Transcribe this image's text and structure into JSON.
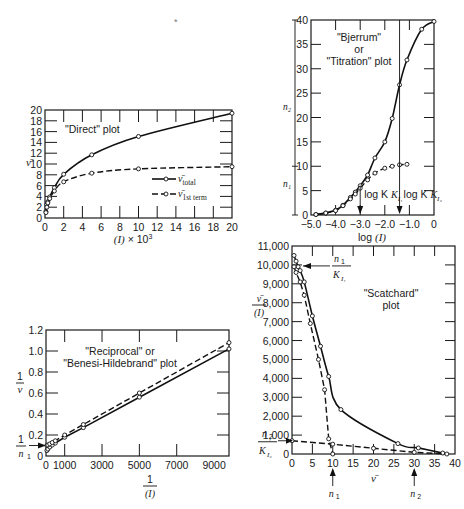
{
  "figure": {
    "stray_mark": "*"
  },
  "chart_data": [
    {
      "id": "direct",
      "type": "line",
      "title": "\"Direct\" plot",
      "xlabel": "(I) × 10³",
      "ylabel": "ν̄",
      "xlim": [
        0,
        20
      ],
      "ylim": [
        0,
        20
      ],
      "xticks": [
        0,
        2,
        4,
        6,
        8,
        10,
        12,
        14,
        16,
        18,
        20
      ],
      "yticks": [
        0,
        2,
        4,
        6,
        8,
        10,
        12,
        14,
        16,
        18,
        20
      ],
      "legend": [
        {
          "label": "ν̄",
          "sub": "total",
          "style": "solid"
        },
        {
          "label": "ν̄",
          "sub": "1st term",
          "style": "dashed"
        }
      ],
      "series": [
        {
          "name": "ν̄ total",
          "style": "solid",
          "x": [
            0.1,
            0.2,
            0.3,
            0.5,
            1,
            2,
            5,
            10,
            20
          ],
          "y": [
            1.2,
            2.5,
            3.0,
            3.9,
            5.6,
            8.1,
            11.7,
            15.1,
            19.4
          ]
        },
        {
          "name": "ν̄ 1st term",
          "style": "dashed",
          "x": [
            0.1,
            0.2,
            0.3,
            0.5,
            1,
            2,
            5,
            10,
            20
          ],
          "y": [
            1.0,
            2.0,
            2.8,
            3.6,
            5.0,
            6.7,
            8.3,
            9.1,
            9.5
          ]
        }
      ]
    },
    {
      "id": "bjerrum",
      "type": "line",
      "title": "\"Bjerrum\" or \"Titration\" plot",
      "title_lines": [
        "\"Bjerrum\"",
        "or",
        "\"Titration\" plot"
      ],
      "xlabel": "log (I)",
      "ylabel_upper": "n₂",
      "ylabel_lower": "n₁",
      "xlim": [
        -5.0,
        0
      ],
      "ylim": [
        0,
        40
      ],
      "xticks": [
        -5.0,
        -4.0,
        -3.0,
        -2.0,
        -1.0,
        0
      ],
      "xtick_labels": [
        "−5.0",
        "−4.0",
        "−3.0",
        "−2.0",
        "−1.0",
        "0"
      ],
      "yticks": [
        0,
        5,
        10,
        15,
        20,
        25,
        30,
        35,
        40
      ],
      "annotations": [
        {
          "text": "log K",
          "sub": "I₁",
          "x": -3.0
        },
        {
          "text": "log K",
          "sub": "I₂",
          "x": -1.4
        }
      ],
      "series": [
        {
          "name": "ν̄ total",
          "style": "solid",
          "x": [
            -4.8,
            -4.4,
            -4.0,
            -3.7,
            -3.4,
            -3.2,
            -3.0,
            -2.7,
            -2.4,
            -2.0,
            -1.7,
            -1.4,
            -1.1,
            -0.5,
            0
          ],
          "y": [
            0.1,
            0.4,
            1.0,
            2.0,
            3.6,
            4.7,
            6.0,
            8.2,
            11.7,
            15.0,
            19.8,
            26.7,
            31.8,
            38.1,
            39.7
          ]
        },
        {
          "name": "ν̄ 1st term",
          "style": "dashed",
          "x": [
            -4.8,
            -4.4,
            -4.0,
            -3.7,
            -3.4,
            -3.2,
            -3.0,
            -2.7,
            -2.4,
            -2.0,
            -1.7,
            -1.4,
            -1.1
          ],
          "y": [
            0.1,
            0.4,
            0.9,
            1.9,
            3.3,
            4.3,
            5.5,
            7.2,
            8.6,
            9.6,
            10.0,
            10.3,
            10.4
          ]
        }
      ]
    },
    {
      "id": "reciprocal",
      "type": "line",
      "title": "\"Reciprocal\" or \"Benesi-Hildebrand\" plot",
      "title_lines": [
        "\"Reciprocal\" or",
        "\"Benesi-Hildebrand\" plot"
      ],
      "xlabel": "1/(I)",
      "ylabel": "1/ν",
      "intercept_label": "1/n₁",
      "xlim": [
        0,
        9800
      ],
      "ylim": [
        0,
        1.2
      ],
      "xticks": [
        0,
        1000,
        3000,
        5000,
        7000,
        9000
      ],
      "xtick_labels": [
        "0",
        "1000",
        "3000",
        "5000",
        "7000",
        "9000"
      ],
      "yticks": [
        0,
        0.2,
        0.4,
        0.6,
        0.8,
        1.0,
        1.2
      ],
      "ytick_labels": [
        "0",
        "0.2",
        "0.4",
        "0.6",
        "0.8",
        "1.0",
        "1.2"
      ],
      "series": [
        {
          "name": "total",
          "style": "solid",
          "x": [
            50,
            100,
            200,
            333,
            500,
            1000,
            2000,
            5000,
            9800
          ],
          "y": [
            0.052,
            0.066,
            0.085,
            0.104,
            0.123,
            0.178,
            0.27,
            0.56,
            1.02
          ]
        },
        {
          "name": "1st term",
          "style": "dashed",
          "x": [
            50,
            100,
            200,
            333,
            500,
            1000,
            2000,
            5000,
            9800
          ],
          "y": [
            0.1,
            0.105,
            0.115,
            0.128,
            0.145,
            0.2,
            0.3,
            0.6,
            1.08
          ]
        }
      ]
    },
    {
      "id": "scatchard",
      "type": "line",
      "title": "\"Scatchard\" plot",
      "title_lines": [
        "\"Scatchard\"",
        "plot"
      ],
      "xlabel": "ν̄",
      "ylabel": "ν̄/(I)",
      "xlim": [
        0,
        40
      ],
      "ylim": [
        0,
        11000
      ],
      "xticks": [
        0,
        5,
        10,
        15,
        20,
        25,
        30,
        35,
        40
      ],
      "yticks": [
        0,
        1000,
        2000,
        3000,
        4000,
        5000,
        6000,
        7000,
        8000,
        9000,
        10000,
        11000
      ],
      "ytick_labels": [
        "0",
        "1,000",
        "2,000",
        "3,000",
        "4,000",
        "5,000",
        "6,000",
        "7,000",
        "8,000",
        "9,000",
        "10,000",
        "11,000"
      ],
      "annotations": [
        {
          "text": "n₁/K_I₁",
          "at": "y",
          "value": 10000
        },
        {
          "text": "n₂/K_I₂",
          "at": "y",
          "value": 700
        },
        {
          "text": "n₁",
          "at": "x",
          "value": 10
        },
        {
          "text": "n₂",
          "at": "x",
          "value": 30
        }
      ],
      "series": [
        {
          "name": "total",
          "style": "solid",
          "x": [
            0.5,
            1.0,
            1.5,
            2.0,
            3.0,
            5.0,
            7.0,
            9.0,
            12,
            26,
            31,
            37
          ],
          "y": [
            10500,
            10200,
            9900,
            9700,
            9100,
            7300,
            5700,
            4100,
            2350,
            550,
            320,
            50
          ]
        },
        {
          "name": "1st term",
          "style": "dashed",
          "x": [
            0.5,
            1.0,
            2.0,
            3.0,
            4.5,
            6.5,
            8.0,
            9.0,
            10
          ],
          "y": [
            9900,
            9600,
            9100,
            8400,
            6900,
            5000,
            3400,
            800,
            0
          ]
        },
        {
          "name": "2nd term",
          "style": "dashed",
          "x": [
            0,
            10,
            20,
            30,
            38
          ],
          "y": [
            700,
            520,
            300,
            90,
            0
          ]
        }
      ]
    }
  ]
}
